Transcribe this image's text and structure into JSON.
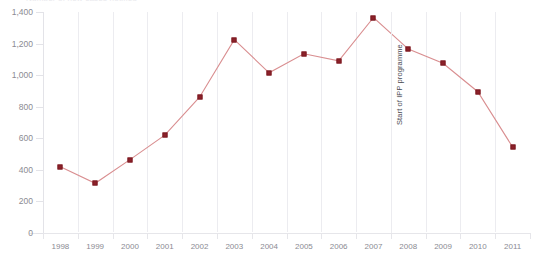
{
  "chart_data": {
    "type": "line",
    "title": "Number of new cases notified",
    "xlabel": "",
    "ylabel": "",
    "categories": [
      "1998",
      "1999",
      "2000",
      "2001",
      "2002",
      "2003",
      "2004",
      "2005",
      "2006",
      "2007",
      "2008",
      "2009",
      "2010",
      "2011"
    ],
    "values": [
      420,
      315,
      465,
      620,
      860,
      1225,
      1015,
      1135,
      1090,
      1365,
      1165,
      1075,
      895,
      545
    ],
    "series": [
      {
        "name": "New cases",
        "values": [
          420,
          315,
          465,
          620,
          860,
          1225,
          1015,
          1135,
          1090,
          1365,
          1165,
          1075,
          895,
          545
        ]
      }
    ],
    "ylim": [
      0,
      1400
    ],
    "yticks": [
      0,
      200,
      400,
      600,
      800,
      1000,
      1200,
      1400
    ],
    "ytick_labels": [
      "0",
      "200",
      "400",
      "600",
      "800",
      "1,000",
      "1,200",
      "1,400"
    ],
    "grid": "vertical",
    "legend": "none",
    "marker_color": "#8d2029",
    "line_color": "#d98e90",
    "grid_color": "#ececf0",
    "tick_label_color": "#8b8b93",
    "annotations": [
      {
        "text": "Start of IPP programme",
        "at_category": "2008",
        "orientation": "vertical"
      }
    ]
  }
}
